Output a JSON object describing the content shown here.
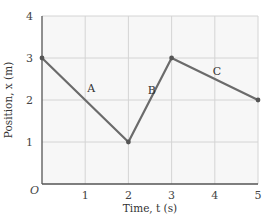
{
  "chart_data": {
    "type": "line",
    "title": "",
    "xlabel": "Time, t (s)",
    "ylabel": "Position, x (m)",
    "xlim": [
      0,
      5
    ],
    "ylim": [
      0,
      4
    ],
    "x_ticks": [
      "1",
      "2",
      "3",
      "4",
      "5"
    ],
    "y_ticks": [
      "1",
      "2",
      "3",
      "4"
    ],
    "origin_label": "O",
    "grid": true,
    "legend": null,
    "series": [
      {
        "name": "position",
        "x": [
          0,
          2,
          3,
          5
        ],
        "y": [
          3,
          1,
          3,
          2
        ]
      }
    ],
    "annotations": [
      {
        "text": "A",
        "segment": "0-2 s",
        "x": 1.05,
        "y": 2.2
      },
      {
        "text": "B",
        "segment": "2-3 s",
        "x": 2.45,
        "y": 2.15
      },
      {
        "text": "C",
        "segment": "3-5 s",
        "x": 3.95,
        "y": 2.6
      }
    ]
  },
  "colors": {
    "line": "#6b6b6b",
    "grid": "#d4d4d4",
    "axis": "#555555",
    "plot_bg": "#f7f7f7",
    "point": "#555555"
  }
}
